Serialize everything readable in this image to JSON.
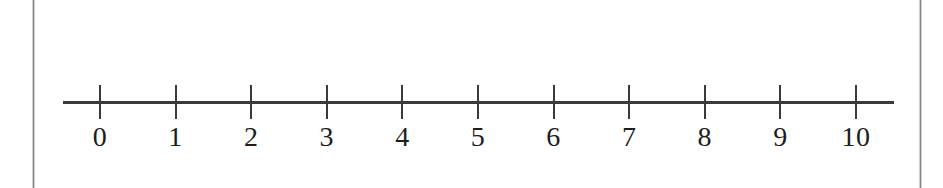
{
  "figure": {
    "width": 943,
    "height": 188,
    "background_color": "#ffffff",
    "page_edge_color": "#8a8a8a",
    "ink_color": "#3a3a3a",
    "label_color": "#1d1d1d"
  },
  "chart_data": {
    "type": "line",
    "title": "",
    "subtitle": "",
    "xlabel": "",
    "ylabel": "",
    "orientation": "horizontal",
    "grid": false,
    "legend": null,
    "xlim": [
      0,
      10
    ],
    "tick_step": 1,
    "tick_values": [
      0,
      1,
      2,
      3,
      4,
      5,
      6,
      7,
      8,
      9,
      10
    ],
    "tick_labels": [
      "0",
      "1",
      "2",
      "3",
      "4",
      "5",
      "6",
      "7",
      "8",
      "9",
      "10"
    ],
    "annotations": [],
    "series": []
  },
  "geometry": {
    "axis_left_px": 63,
    "axis_right_px": 894,
    "axis_y_px": 101,
    "axis_thickness_px": 3,
    "first_tick_x_px": 100,
    "tick_spacing_px": 75.6,
    "tick_top_px": 85,
    "tick_height_px": 34,
    "tick_thickness_px": 2,
    "label_top_px": 122,
    "left_edge_x_px": 32,
    "right_edge_x_px": 919
  }
}
